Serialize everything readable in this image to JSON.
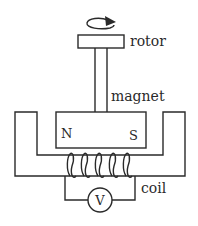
{
  "diagram": {
    "type": "generator-schematic",
    "labels": {
      "rotor": "rotor",
      "magnet": "magnet",
      "north_pole": "N",
      "south_pole": "S",
      "coil": "coil",
      "voltmeter": "V"
    },
    "icons": {
      "rotation": "clockwise-rotation-arrow"
    },
    "colors": {
      "stroke": "#2a2a2a",
      "background": "#ffffff"
    }
  }
}
